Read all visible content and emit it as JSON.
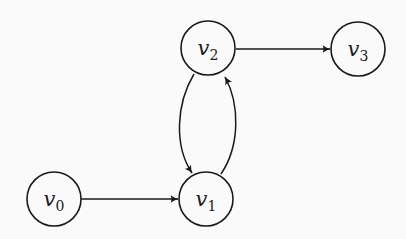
{
  "diagram": {
    "type": "directed-graph",
    "nodes": [
      {
        "id": "v0",
        "base": "v",
        "sub": "0"
      },
      {
        "id": "v1",
        "base": "v",
        "sub": "1"
      },
      {
        "id": "v2",
        "base": "v",
        "sub": "2"
      },
      {
        "id": "v3",
        "base": "v",
        "sub": "3"
      }
    ],
    "edges": [
      {
        "from": "v0",
        "to": "v1",
        "style": "straight"
      },
      {
        "from": "v2",
        "to": "v1",
        "style": "bend-left"
      },
      {
        "from": "v1",
        "to": "v2",
        "style": "bend-left"
      },
      {
        "from": "v2",
        "to": "v3",
        "style": "straight"
      }
    ],
    "colors": {
      "background": "#fafafa",
      "stroke": "#1a1a1a"
    }
  }
}
